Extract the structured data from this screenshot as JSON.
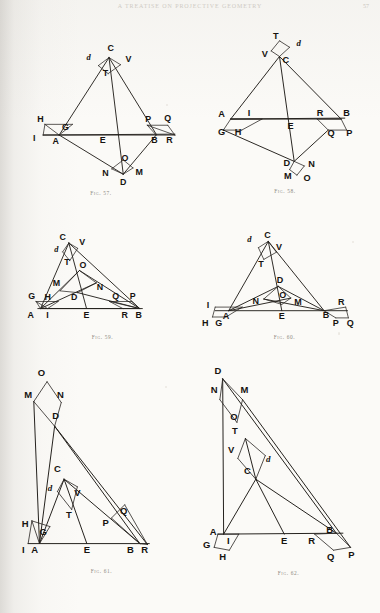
{
  "page": {
    "running_head": "A TREATISE ON PROJECTIVE GEOMETRY",
    "folio": "57",
    "background_color": "#fbfaf7",
    "ink_color": "#23201c"
  },
  "figures": [
    {
      "id": "fig-57",
      "caption": "Fig. 57.",
      "viewbox": "0 0 190 200",
      "points": [
        {
          "label": "C",
          "x": 106,
          "y": 30,
          "style": "pt"
        },
        {
          "label": "d",
          "x": 81,
          "y": 40,
          "style": "pt-it"
        },
        {
          "label": "V",
          "x": 126,
          "y": 42,
          "style": "pt"
        },
        {
          "label": "T",
          "x": 100,
          "y": 58,
          "style": "pt"
        },
        {
          "label": "H",
          "x": 27,
          "y": 110,
          "style": "pt"
        },
        {
          "label": "G",
          "x": 55,
          "y": 119,
          "style": "pt"
        },
        {
          "label": "I",
          "x": 20,
          "y": 131,
          "style": "pt"
        },
        {
          "label": "A",
          "x": 44,
          "y": 134,
          "style": "pt"
        },
        {
          "label": "E",
          "x": 97,
          "y": 133,
          "style": "pt"
        },
        {
          "label": "P",
          "x": 148,
          "y": 110,
          "style": "pt"
        },
        {
          "label": "Q",
          "x": 170,
          "y": 109,
          "style": "pt"
        },
        {
          "label": "B",
          "x": 155,
          "y": 133,
          "style": "pt"
        },
        {
          "label": "R",
          "x": 172,
          "y": 133,
          "style": "pt"
        },
        {
          "label": "O",
          "x": 122,
          "y": 154,
          "style": "pt"
        },
        {
          "label": "N",
          "x": 100,
          "y": 170,
          "style": "pt"
        },
        {
          "label": "M",
          "x": 138,
          "y": 169,
          "style": "pt"
        },
        {
          "label": "D",
          "x": 120,
          "y": 180,
          "style": "pt"
        }
      ]
    },
    {
      "id": "fig-58",
      "caption": "Fig. 58.",
      "viewbox": "0 0 190 200",
      "points": [
        {
          "label": "T",
          "x": 85,
          "y": 22,
          "style": "pt"
        },
        {
          "label": "d",
          "x": 110,
          "y": 30,
          "style": "pt-it"
        },
        {
          "label": "V",
          "x": 73,
          "y": 42,
          "style": "pt"
        },
        {
          "label": "C",
          "x": 96,
          "y": 48,
          "style": "pt"
        },
        {
          "label": "A",
          "x": 26,
          "y": 107,
          "style": "pt"
        },
        {
          "label": "I",
          "x": 56,
          "y": 106,
          "style": "pt"
        },
        {
          "label": "E",
          "x": 101,
          "y": 120,
          "style": "pt"
        },
        {
          "label": "R",
          "x": 133,
          "y": 106,
          "style": "pt"
        },
        {
          "label": "B",
          "x": 162,
          "y": 106,
          "style": "pt"
        },
        {
          "label": "G",
          "x": 26,
          "y": 127,
          "style": "pt"
        },
        {
          "label": "H",
          "x": 44,
          "y": 127,
          "style": "pt"
        },
        {
          "label": "Q",
          "x": 145,
          "y": 128,
          "style": "pt"
        },
        {
          "label": "P",
          "x": 165,
          "y": 128,
          "style": "pt"
        },
        {
          "label": "D",
          "x": 97,
          "y": 160,
          "style": "pt"
        },
        {
          "label": "N",
          "x": 124,
          "y": 161,
          "style": "pt"
        },
        {
          "label": "M",
          "x": 98,
          "y": 175,
          "style": "pt"
        },
        {
          "label": "O",
          "x": 119,
          "y": 177,
          "style": "pt"
        }
      ]
    },
    {
      "id": "fig-59",
      "caption": "Fig. 59.",
      "viewbox": "0 0 190 140",
      "points": [
        {
          "label": "C",
          "x": 50,
          "y": 20,
          "style": "pt"
        },
        {
          "label": "V",
          "x": 72,
          "y": 26,
          "style": "pt"
        },
        {
          "label": "d",
          "x": 43,
          "y": 34,
          "style": "pt-it"
        },
        {
          "label": "T",
          "x": 55,
          "y": 48,
          "style": "pt"
        },
        {
          "label": "O",
          "x": 73,
          "y": 52,
          "style": "pt"
        },
        {
          "label": "M",
          "x": 43,
          "y": 72,
          "style": "pt"
        },
        {
          "label": "N",
          "x": 92,
          "y": 76,
          "style": "pt"
        },
        {
          "label": "G",
          "x": 15,
          "y": 87,
          "style": "pt"
        },
        {
          "label": "H",
          "x": 33,
          "y": 88,
          "style": "pt"
        },
        {
          "label": "D",
          "x": 63,
          "y": 88,
          "style": "pt"
        },
        {
          "label": "Q",
          "x": 110,
          "y": 87,
          "style": "pt"
        },
        {
          "label": "P",
          "x": 129,
          "y": 87,
          "style": "pt"
        },
        {
          "label": "A",
          "x": 14,
          "y": 108,
          "style": "pt"
        },
        {
          "label": "I",
          "x": 33,
          "y": 108,
          "style": "pt"
        },
        {
          "label": "E",
          "x": 77,
          "y": 108,
          "style": "pt"
        },
        {
          "label": "R",
          "x": 120,
          "y": 108,
          "style": "pt"
        },
        {
          "label": "B",
          "x": 136,
          "y": 108,
          "style": "pt"
        }
      ]
    },
    {
      "id": "fig-60",
      "caption": "Fig. 60.",
      "viewbox": "0 0 190 140",
      "points": [
        {
          "label": "d",
          "x": 56,
          "y": 24,
          "style": "pt-it"
        },
        {
          "label": "C",
          "x": 76,
          "y": 20,
          "style": "pt"
        },
        {
          "label": "V",
          "x": 89,
          "y": 33,
          "style": "pt"
        },
        {
          "label": "T",
          "x": 69,
          "y": 52,
          "style": "pt"
        },
        {
          "label": "D",
          "x": 90,
          "y": 70,
          "style": "pt"
        },
        {
          "label": "O",
          "x": 93,
          "y": 86,
          "style": "pt"
        },
        {
          "label": "N",
          "x": 63,
          "y": 93,
          "style": "pt"
        },
        {
          "label": "M",
          "x": 110,
          "y": 94,
          "style": "pt"
        },
        {
          "label": "I",
          "x": 10,
          "y": 97,
          "style": "pt"
        },
        {
          "label": "R",
          "x": 158,
          "y": 94,
          "style": "pt"
        },
        {
          "label": "A",
          "x": 30,
          "y": 110,
          "style": "pt"
        },
        {
          "label": "E",
          "x": 92,
          "y": 110,
          "style": "pt"
        },
        {
          "label": "B",
          "x": 141,
          "y": 108,
          "style": "pt"
        },
        {
          "label": "H",
          "x": 7,
          "y": 117,
          "style": "pt"
        },
        {
          "label": "G",
          "x": 22,
          "y": 117,
          "style": "pt"
        },
        {
          "label": "P",
          "x": 152,
          "y": 117,
          "style": "pt"
        },
        {
          "label": "Q",
          "x": 168,
          "y": 117,
          "style": "pt"
        }
      ]
    },
    {
      "id": "fig-61",
      "caption": "Fig. 61.",
      "viewbox": "0 0 175 245",
      "points": [
        {
          "label": "O",
          "x": 24,
          "y": 16,
          "style": "pt"
        },
        {
          "label": "M",
          "x": 10,
          "y": 40,
          "style": "pt"
        },
        {
          "label": "N",
          "x": 44,
          "y": 40,
          "style": "pt"
        },
        {
          "label": "D",
          "x": 39,
          "y": 62,
          "style": "pt"
        },
        {
          "label": "C",
          "x": 41,
          "y": 118,
          "style": "pt"
        },
        {
          "label": "d",
          "x": 33,
          "y": 138,
          "style": "pt-it"
        },
        {
          "label": "V",
          "x": 62,
          "y": 143,
          "style": "pt"
        },
        {
          "label": "T",
          "x": 53,
          "y": 166,
          "style": "pt"
        },
        {
          "label": "Q",
          "x": 111,
          "y": 162,
          "style": "pt"
        },
        {
          "label": "P",
          "x": 92,
          "y": 175,
          "style": "pt"
        },
        {
          "label": "H",
          "x": 7,
          "y": 176,
          "style": "pt"
        },
        {
          "label": "G",
          "x": 26,
          "y": 184,
          "style": "pt"
        },
        {
          "label": "I",
          "x": 5,
          "y": 203,
          "style": "pt"
        },
        {
          "label": "A",
          "x": 17,
          "y": 203,
          "style": "pt"
        },
        {
          "label": "E",
          "x": 72,
          "y": 203,
          "style": "pt"
        },
        {
          "label": "B",
          "x": 118,
          "y": 203,
          "style": "pt"
        },
        {
          "label": "R",
          "x": 133,
          "y": 203,
          "style": "pt"
        }
      ]
    },
    {
      "id": "fig-62",
      "caption": "Fig. 62.",
      "viewbox": "0 0 185 245",
      "points": [
        {
          "label": "D",
          "x": 18,
          "y": 14,
          "style": "pt"
        },
        {
          "label": "N",
          "x": 14,
          "y": 34,
          "style": "pt"
        },
        {
          "label": "M",
          "x": 46,
          "y": 34,
          "style": "pt"
        },
        {
          "label": "O",
          "x": 35,
          "y": 63,
          "style": "pt"
        },
        {
          "label": "T",
          "x": 36,
          "y": 78,
          "style": "pt"
        },
        {
          "label": "V",
          "x": 32,
          "y": 98,
          "style": "pt"
        },
        {
          "label": "d",
          "x": 71,
          "y": 108,
          "style": "pt-it"
        },
        {
          "label": "C",
          "x": 49,
          "y": 120,
          "style": "pt"
        },
        {
          "label": "A",
          "x": 13,
          "y": 184,
          "style": "pt"
        },
        {
          "label": "B",
          "x": 136,
          "y": 182,
          "style": "pt"
        },
        {
          "label": "G",
          "x": 6,
          "y": 198,
          "style": "pt"
        },
        {
          "label": "I",
          "x": 29,
          "y": 194,
          "style": "pt"
        },
        {
          "label": "E",
          "x": 88,
          "y": 194,
          "style": "pt"
        },
        {
          "label": "R",
          "x": 117,
          "y": 194,
          "style": "pt"
        },
        {
          "label": "H",
          "x": 23,
          "y": 211,
          "style": "pt"
        },
        {
          "label": "Q",
          "x": 137,
          "y": 211,
          "style": "pt"
        },
        {
          "label": "P",
          "x": 159,
          "y": 209,
          "style": "pt"
        }
      ]
    }
  ]
}
